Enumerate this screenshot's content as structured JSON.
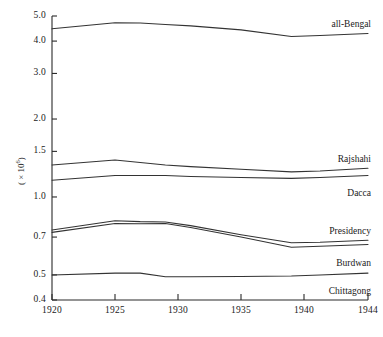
{
  "chart_data": {
    "type": "line",
    "title": "",
    "subtitle": "",
    "xlabel": "",
    "ylabel": "( × 10⁶ )",
    "ylabel_text": "( × 10",
    "ylabel_exponent": "6",
    "ylabel_close": ")",
    "yscale": "log",
    "ylim": [
      0.4,
      5.0
    ],
    "xlim": [
      1920,
      1944
    ],
    "grid": false,
    "legend_position": "inline-right",
    "x_ticks": [
      "1920",
      "1925",
      "1930",
      "1935",
      "1940",
      "1944"
    ],
    "x_tick_values": [
      1920,
      1925,
      1930,
      1935,
      1940,
      1944
    ],
    "y_ticks": [
      "0.4",
      "0.5",
      "0.7",
      "1.0",
      "1.5",
      "2.0",
      "3.0",
      "4.0",
      "5.0"
    ],
    "y_tick_values": [
      0.4,
      0.5,
      0.7,
      1.0,
      1.5,
      2.0,
      3.0,
      4.0,
      5.0
    ],
    "x": [
      1920,
      1925,
      1927,
      1929,
      1931,
      1935,
      1939,
      1941,
      1944
    ],
    "series": [
      {
        "name": "all-Bengal",
        "values": [
          4.46,
          4.71,
          4.7,
          4.64,
          4.58,
          4.42,
          4.17,
          4.2,
          4.28
        ]
      },
      {
        "name": "Rajshahi",
        "values": [
          1.33,
          1.39,
          1.36,
          1.33,
          1.31,
          1.28,
          1.25,
          1.26,
          1.29
        ]
      },
      {
        "name": "Dacca",
        "values": [
          1.16,
          1.21,
          1.21,
          1.21,
          1.2,
          1.19,
          1.18,
          1.19,
          1.21
        ]
      },
      {
        "name": "Presidency",
        "values": [
          0.745,
          0.81,
          0.803,
          0.8,
          0.775,
          0.715,
          0.665,
          0.668,
          0.68
        ]
      },
      {
        "name": "Burdwan",
        "values": [
          0.73,
          0.79,
          0.788,
          0.79,
          0.762,
          0.7,
          0.64,
          0.645,
          0.655
        ]
      },
      {
        "name": "Chittagong",
        "values": [
          0.5,
          0.508,
          0.508,
          0.492,
          0.492,
          0.493,
          0.495,
          0.5,
          0.508
        ]
      }
    ],
    "line_color": "#333333",
    "axis_color": "#2a2a2a",
    "background": "#ffffff"
  }
}
